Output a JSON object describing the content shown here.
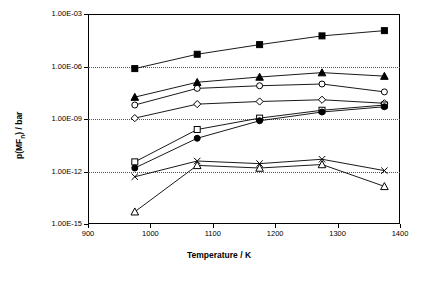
{
  "chart_data": {
    "type": "line",
    "title": "",
    "xlabel": "Temperature / K",
    "ylabel": "p(MF",
    "ylabel_sub": "n",
    "ylabel_tail": ") / bar",
    "xlim": [
      900,
      1400
    ],
    "ylim_exp": [
      -15,
      -3
    ],
    "xticks": [
      900,
      1000,
      1100,
      1200,
      1300,
      1400
    ],
    "xtick_labels": [
      "900",
      "1000",
      "1100",
      "1200",
      "1300",
      "1400"
    ],
    "yticks_exp": [
      -15,
      -12,
      -9,
      -6,
      -3
    ],
    "ytick_labels": [
      "1.00E-15",
      "1.00E-12",
      "1.00E-09",
      "1.00E-06",
      "1.00E-03"
    ],
    "grid": "horizontal-dotted",
    "legend": "none",
    "x": [
      975,
      1075,
      1175,
      1275,
      1375
    ],
    "series": [
      {
        "name": "filled-square",
        "marker": "filled-square",
        "log_values": [
          -6.12,
          -5.3,
          -4.75,
          -4.25,
          -3.95
        ]
      },
      {
        "name": "filled-triangle",
        "marker": "filled-triangle",
        "log_values": [
          -7.75,
          -6.9,
          -6.6,
          -6.35,
          -6.55
        ]
      },
      {
        "name": "open-circle",
        "marker": "open-circle",
        "log_values": [
          -8.2,
          -7.25,
          -7.1,
          -7.0,
          -7.45
        ]
      },
      {
        "name": "open-diamond",
        "marker": "open-diamond",
        "log_values": [
          -8.95,
          -8.15,
          -8.0,
          -7.9,
          -8.1
        ]
      },
      {
        "name": "open-square",
        "marker": "open-square",
        "log_values": [
          -11.45,
          -9.6,
          -8.95,
          -8.5,
          -8.2
        ]
      },
      {
        "name": "filled-circle",
        "marker": "filled-circle",
        "log_values": [
          -11.8,
          -10.1,
          -9.1,
          -8.6,
          -8.3
        ]
      },
      {
        "name": "cross",
        "marker": "cross",
        "log_values": [
          -12.3,
          -11.4,
          -11.55,
          -11.3,
          -11.95
        ]
      },
      {
        "name": "open-triangle",
        "marker": "open-triangle",
        "log_values": [
          -14.3,
          -11.65,
          -11.8,
          -11.6,
          -12.85
        ]
      }
    ]
  }
}
